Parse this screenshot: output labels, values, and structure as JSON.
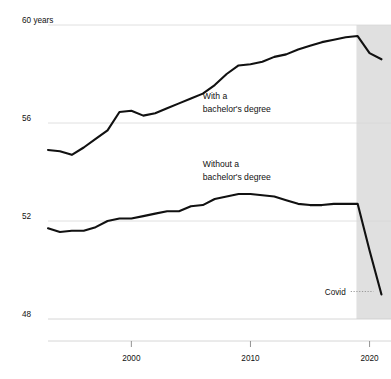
{
  "chart_data": {
    "type": "line",
    "title": "",
    "subtitle": "",
    "xlabel": "",
    "ylabel": "",
    "xlim": [
      1993,
      2021.8
    ],
    "ylim": [
      48,
      60
    ],
    "grid": true,
    "gridlines_y": [
      48,
      52,
      56,
      60
    ],
    "y_tick_labels": [
      "60 years",
      "56",
      "52",
      "48"
    ],
    "y_tick_values": [
      60,
      56,
      52,
      48
    ],
    "x_tick_labels": [
      "2000",
      "2010",
      "2020"
    ],
    "x_tick_values": [
      2000,
      2010,
      2020
    ],
    "legend_position": "inline-annotations",
    "annotations": [
      {
        "id": "with-degree",
        "line1": "With a",
        "line2": "bachelor's degree",
        "x": 2006.0,
        "y": 57.0
      },
      {
        "id": "without-degree",
        "line1": "Without a",
        "line2": "bachelor's degree",
        "x": 2006.0,
        "y": 54.2
      },
      {
        "id": "covid",
        "label": "Covid",
        "x": 2018.0,
        "y": 49.0
      }
    ],
    "shaded_region": {
      "label": "Covid",
      "x_start": 2018.9,
      "x_end": 2021.8,
      "color": "#e0e0e0"
    },
    "series": [
      {
        "name": "With a bachelor's degree",
        "color": "#111111",
        "x": [
          1993,
          1994,
          1995,
          1996,
          1997,
          1998,
          1999,
          2000,
          2001,
          2002,
          2003,
          2004,
          2005,
          2006,
          2007,
          2008,
          2009,
          2010,
          2011,
          2012,
          2013,
          2014,
          2015,
          2016,
          2017,
          2018,
          2019,
          2020,
          2021
        ],
        "values": [
          54.9,
          54.85,
          54.7,
          55.0,
          55.35,
          55.7,
          56.45,
          56.5,
          56.3,
          56.4,
          56.6,
          56.8,
          57.0,
          57.2,
          57.55,
          58.0,
          58.35,
          58.4,
          58.5,
          58.7,
          58.8,
          59.0,
          59.15,
          59.3,
          59.4,
          59.5,
          59.55,
          58.85,
          58.6
        ]
      },
      {
        "name": "Without a bachelor's degree",
        "color": "#111111",
        "x": [
          1993,
          1994,
          1995,
          1996,
          1997,
          1998,
          1999,
          2000,
          2001,
          2002,
          2003,
          2004,
          2005,
          2006,
          2007,
          2008,
          2009,
          2010,
          2011,
          2012,
          2013,
          2014,
          2015,
          2016,
          2017,
          2018,
          2019,
          2020,
          2021
        ],
        "values": [
          51.7,
          51.55,
          51.6,
          51.6,
          51.75,
          52.0,
          52.1,
          52.1,
          52.2,
          52.3,
          52.4,
          52.4,
          52.6,
          52.65,
          52.9,
          53.0,
          53.1,
          53.1,
          53.05,
          53.0,
          52.85,
          52.7,
          52.65,
          52.65,
          52.7,
          52.7,
          52.7,
          50.8,
          49.0
        ]
      }
    ]
  },
  "axes": {
    "y_axis_name": "Life expectancy (years)",
    "x_axis_name": "Year"
  }
}
